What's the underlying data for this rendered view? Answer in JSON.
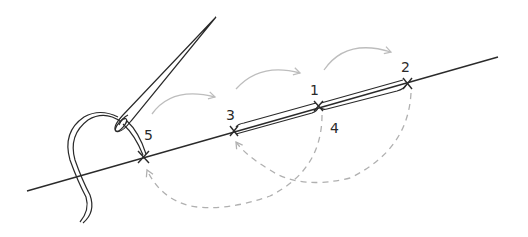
{
  "diagram": {
    "points": [
      {
        "id": "p1",
        "label": "1",
        "x": 318,
        "y": 106,
        "label_x": 314,
        "label_y": 95
      },
      {
        "id": "p2",
        "label": "2",
        "x": 407,
        "y": 83,
        "label_x": 402,
        "label_y": 72
      },
      {
        "id": "p3",
        "label": "3",
        "x": 234,
        "y": 131,
        "label_x": 227,
        "label_y": 120
      },
      {
        "id": "p4",
        "label": "4",
        "x": 318,
        "y": 106,
        "label_x": 330,
        "label_y": 133
      },
      {
        "id": "p5",
        "label": "5",
        "x": 143,
        "y": 157,
        "label_x": 144,
        "label_y": 140
      }
    ],
    "colors": {
      "line": "#2a2a2a",
      "arrow_solid": "#bdbdbd",
      "arrow_dashed": "#b0b0b0",
      "background": "#ffffff"
    }
  }
}
